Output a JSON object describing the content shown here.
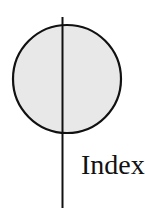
{
  "diagram": {
    "label": "Index",
    "circle": {
      "cx": 67,
      "cy": 79,
      "r": 54,
      "fill": "#e8e8e8",
      "stroke": "#111111"
    },
    "line": {
      "x": 62.5,
      "y1": 17,
      "y2": 208,
      "stroke": "#111111"
    }
  }
}
